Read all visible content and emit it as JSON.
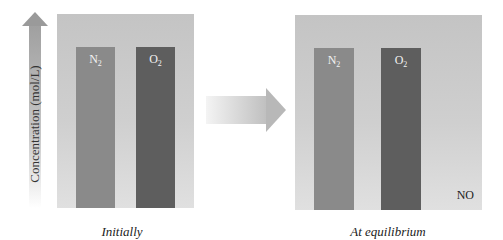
{
  "axis": {
    "label": "Concentration (mol/L)",
    "icon": "up-arrow-icon"
  },
  "transition": {
    "icon": "right-arrow-icon"
  },
  "panels": [
    {
      "caption": "Initially",
      "species": [
        {
          "name": "N",
          "subscript": "2",
          "color": "#8a8a8a",
          "relative_height": 0.83
        },
        {
          "name": "O",
          "subscript": "2",
          "color": "#5e5e5e",
          "relative_height": 0.83
        }
      ]
    },
    {
      "caption": "At equilibrium",
      "species": [
        {
          "name": "N",
          "subscript": "2",
          "color": "#8a8a8a",
          "relative_height": 0.83
        },
        {
          "name": "O",
          "subscript": "2",
          "color": "#5e5e5e",
          "relative_height": 0.83
        },
        {
          "name": "NO",
          "subscript": "",
          "color": "",
          "relative_height": 0.0
        }
      ]
    }
  ],
  "colors": {
    "panel_bg": "#c8c8c8",
    "n2": "#8a8a8a",
    "o2": "#5e5e5e"
  }
}
